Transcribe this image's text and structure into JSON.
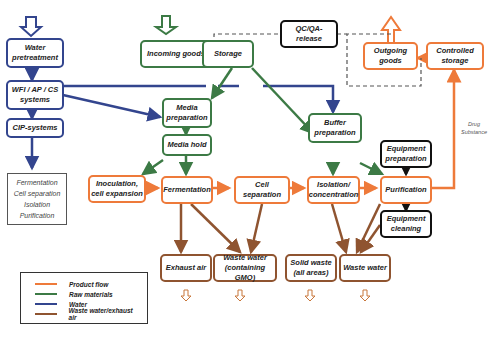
{
  "colors": {
    "product_flow": "#ee7a3a",
    "raw_materials": "#3c7a45",
    "water": "#33458e",
    "waste": "#8f5430",
    "control": "#111111",
    "dashed": "#555555"
  },
  "nodes": {
    "water_pretreatment": "Water pretreatment",
    "wfi_systems": "WFI / AP / CS systems",
    "cip_systems": "CIP-systems",
    "incoming_goods": "Incoming goods",
    "storage": "Storage",
    "qc_qa_release": "QC/QA-release",
    "outgoing_goods": "Outgoing goods",
    "controlled_storage": "Controlled storage",
    "media_preparation": "Media preparation",
    "media_hold": "Media hold",
    "buffer_preparation": "Buffer preparation",
    "equipment_preparation": "Equipment preparation",
    "inoculation": "Inoculation, cell expansion",
    "fermentation": "Fermentation",
    "cell_separation": "Cell separation",
    "isolation": "Isolation/ concentration",
    "purification": "Purification",
    "equipment_cleaning": "Equipment cleaning",
    "exhaust_air": "Exhaust air",
    "waste_water_gmo": "Waste water (containing GMO)",
    "solid_waste": "Solid waste (all areas)",
    "waste_water": "Waste water"
  },
  "cip_targets": [
    "Fermentation",
    "Cell separation",
    "Isolation",
    "Purification"
  ],
  "edge_labels": {
    "drug_substance": "Drug Substance"
  },
  "legend": [
    {
      "label": "Product flow",
      "color": "#ee7a3a"
    },
    {
      "label": "Raw materials",
      "color": "#3c7a45"
    },
    {
      "label": "Water",
      "color": "#33458e"
    },
    {
      "label": "Waste water/exhaust air",
      "color": "#8f5430"
    }
  ]
}
